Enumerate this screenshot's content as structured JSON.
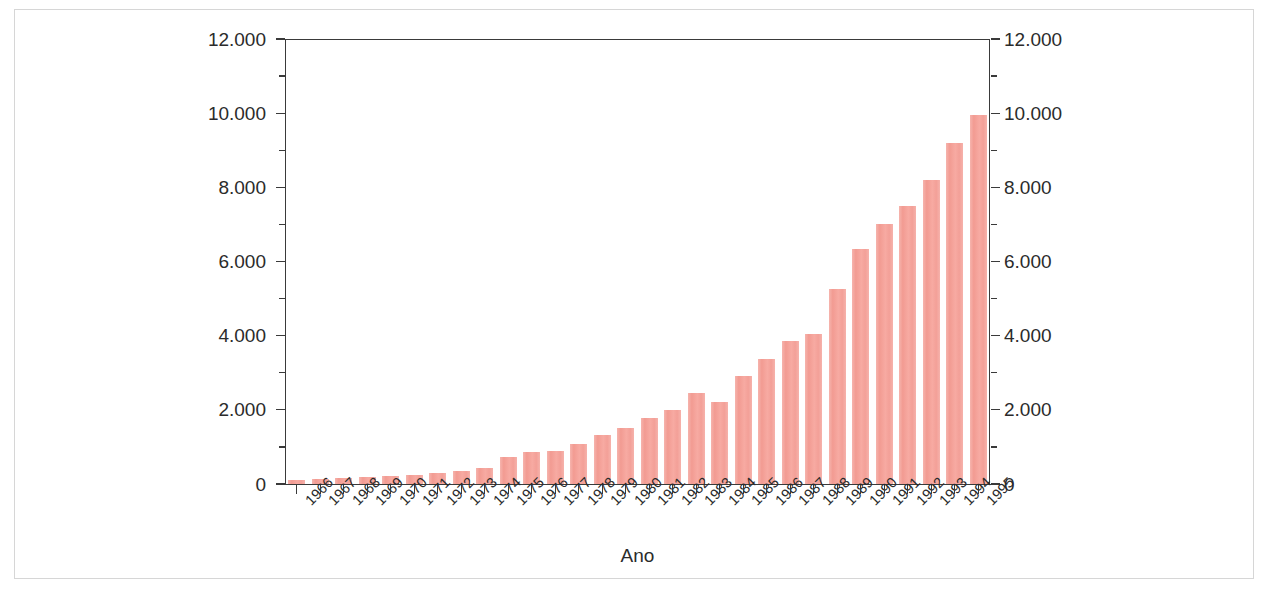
{
  "chart_data": {
    "type": "bar",
    "title": "",
    "xlabel": "Ano",
    "ylabel": "",
    "ylim": [
      0,
      12000
    ],
    "grid": false,
    "legend": null,
    "y_tick_labels": [
      "0",
      "2.000",
      "4.000",
      "6.000",
      "8.000",
      "10.000",
      "12.000"
    ],
    "y_tick_values": [
      0,
      2000,
      4000,
      6000,
      8000,
      10000,
      12000
    ],
    "y_minor_tick_values": [
      1000,
      3000,
      5000,
      7000,
      9000,
      11000
    ],
    "axes": {
      "left_axis_labels": true,
      "right_axis_labels": true,
      "number_format": "period-thousand-separator"
    },
    "bar_color": "#f4a79f",
    "categories": [
      "1966",
      "1967",
      "1968",
      "1969",
      "1970",
      "1971",
      "1972",
      "1973",
      "1974",
      "1975",
      "1976",
      "1977",
      "1978",
      "1979",
      "1980",
      "1981",
      "1982",
      "1983",
      "1984",
      "1985",
      "1986",
      "1987",
      "1988",
      "1989",
      "1990",
      "1991",
      "1992",
      "1993",
      "1994",
      "1995"
    ],
    "values": [
      100,
      130,
      160,
      180,
      210,
      250,
      300,
      350,
      430,
      730,
      860,
      900,
      1080,
      1330,
      1500,
      1780,
      2000,
      2450,
      2200,
      2900,
      3380,
      3850,
      4050,
      5250,
      6350,
      7000,
      7500,
      8200,
      9200,
      9950
    ]
  }
}
